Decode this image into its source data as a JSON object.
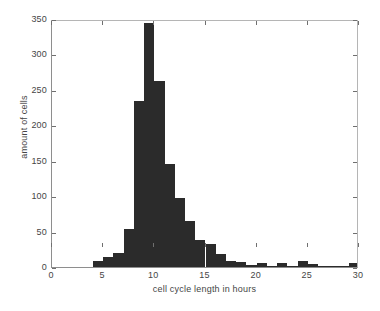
{
  "chart_data": {
    "type": "bar",
    "title": "",
    "subtitle": "",
    "xlabel": "cell cycle length in hours",
    "ylabel": "amount of cells",
    "xlim": [
      0,
      30
    ],
    "ylim": [
      0,
      350
    ],
    "xticks": [
      0,
      5,
      10,
      15,
      20,
      25,
      30
    ],
    "yticks": [
      0,
      50,
      100,
      150,
      200,
      250,
      300,
      350
    ],
    "grid": false,
    "legend": null,
    "bar_color": "#2b2b2b",
    "bin_width": 1,
    "bin_starts": [
      4,
      5,
      6,
      7,
      8,
      9,
      10,
      11,
      12,
      13,
      14,
      15,
      16,
      17,
      18,
      19,
      20,
      21,
      22,
      23,
      24,
      25,
      26,
      27,
      28,
      29
    ],
    "categories": [
      "4-5",
      "5-6",
      "6-7",
      "7-8",
      "8-9",
      "9-10",
      "10-11",
      "11-12",
      "12-13",
      "13-14",
      "14-15",
      "15-16",
      "16-17",
      "17-18",
      "18-19",
      "19-20",
      "20-21",
      "21-22",
      "22-23",
      "23-24",
      "24-25",
      "25-26",
      "26-27",
      "27-28",
      "28-29",
      "29-30"
    ],
    "values": [
      8,
      14,
      20,
      54,
      235,
      345,
      262,
      145,
      98,
      65,
      38,
      33,
      19,
      8,
      7,
      3,
      6,
      2,
      6,
      2,
      8,
      4,
      1,
      1,
      1,
      5
    ],
    "series": [
      {
        "name": "amount of cells",
        "values": [
          8,
          14,
          20,
          54,
          235,
          345,
          262,
          145,
          98,
          65,
          38,
          33,
          19,
          8,
          7,
          3,
          6,
          2,
          6,
          2,
          8,
          4,
          1,
          1,
          1,
          5
        ]
      }
    ],
    "peak_bin": "9-10",
    "peak_value": 345
  }
}
